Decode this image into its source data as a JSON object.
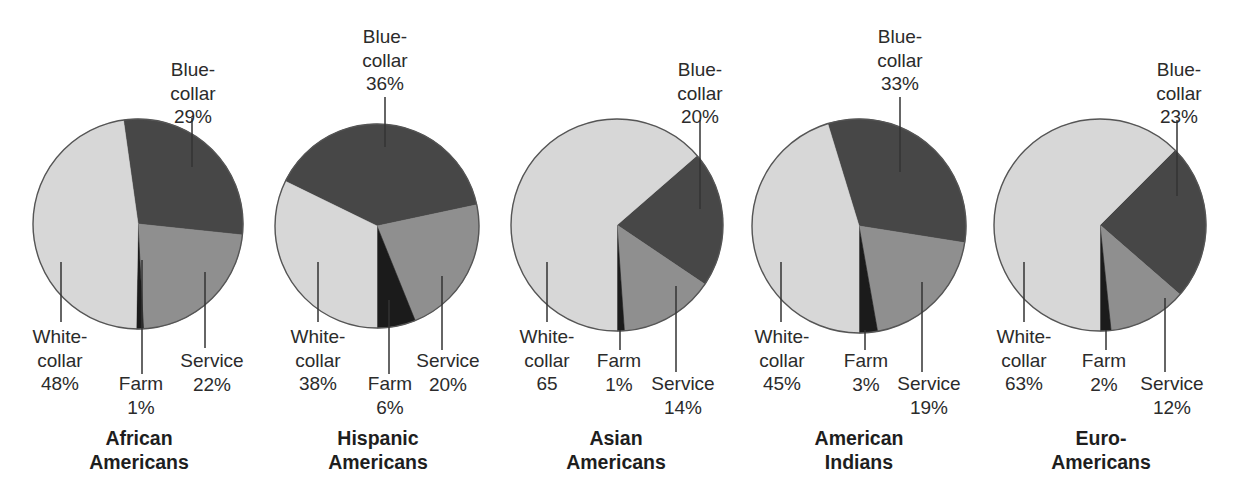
{
  "colors": {
    "white_collar": "#d7d7d7",
    "blue_collar": "#474747",
    "service": "#8f8f8f",
    "farm": "#1b1b1b",
    "outline": "#555555",
    "leader": "#333333"
  },
  "chart_data": {
    "type": "pie",
    "title": "",
    "categories": [
      "Blue-collar",
      "Service",
      "Farm",
      "White-collar"
    ],
    "charts": [
      {
        "title": "African Americans",
        "title_lines": [
          "African",
          "Americans"
        ],
        "center": [
          138,
          224
        ],
        "r": 105,
        "slices": [
          {
            "name": "Blue-collar",
            "value": 29,
            "label_lines": [
              "Blue-",
              "collar",
              "29%"
            ],
            "start": -8,
            "end": 96,
            "color": "blue_collar",
            "label": {
              "x": 193,
              "y": 58
            },
            "leader": [
              [
                192,
                118
              ],
              [
                192,
                167
              ]
            ]
          },
          {
            "name": "Service",
            "value": 22,
            "label_lines": [
              "Service",
              "22%"
            ],
            "start": 96,
            "end": 177,
            "color": "service",
            "label": {
              "x": 212,
              "y": 349
            },
            "leader": [
              [
                205,
                272
              ],
              [
                205,
                348
              ]
            ]
          },
          {
            "name": "Farm",
            "value": 1,
            "label_lines": [
              "Farm",
              "1%"
            ],
            "start": 177,
            "end": 181,
            "color": "farm",
            "label": {
              "x": 141,
              "y": 372
            },
            "leader": [
              [
                142,
                260
              ],
              [
                142,
                374
              ]
            ]
          },
          {
            "name": "White-collar",
            "value": 48,
            "label_lines": [
              "White-",
              "collar",
              "48%"
            ],
            "start": 181,
            "end": 352,
            "color": "white_collar",
            "label": {
              "x": 60,
              "y": 325
            },
            "leader": [
              [
                61,
                262
              ],
              [
                61,
                322
              ]
            ]
          }
        ]
      },
      {
        "title": "Hispanic Americans",
        "title_lines": [
          "Hispanic",
          "Americans"
        ],
        "center": [
          377,
          226
        ],
        "r": 102,
        "slices": [
          {
            "name": "Blue-collar",
            "value": 36,
            "label_lines": [
              "Blue-",
              "collar",
              "36%"
            ],
            "start": -64,
            "end": 78,
            "color": "blue_collar",
            "label": {
              "x": 385,
              "y": 25
            },
            "leader": [
              [
                385,
                97
              ],
              [
                385,
                147
              ]
            ]
          },
          {
            "name": "Service",
            "value": 20,
            "label_lines": [
              "Service",
              "20%"
            ],
            "start": 78,
            "end": 158,
            "color": "service",
            "label": {
              "x": 448,
              "y": 349
            },
            "leader": [
              [
                442,
                276
              ],
              [
                442,
                350
              ]
            ]
          },
          {
            "name": "Farm",
            "value": 6,
            "label_lines": [
              "Farm",
              "6%"
            ],
            "start": 158,
            "end": 180,
            "color": "farm",
            "label": {
              "x": 390,
              "y": 372
            },
            "leader": [
              [
                389,
                300
              ],
              [
                389,
                374
              ]
            ]
          },
          {
            "name": "White-collar",
            "value": 38,
            "label_lines": [
              "White-",
              "collar",
              "38%"
            ],
            "start": 180,
            "end": 296,
            "color": "white_collar",
            "label": {
              "x": 318,
              "y": 325
            },
            "leader": [
              [
                318,
                262
              ],
              [
                318,
                322
              ]
            ]
          }
        ]
      },
      {
        "title": "Asian Americans",
        "title_lines": [
          "Asian",
          "Americans"
        ],
        "center": [
          617,
          225
        ],
        "r": 106,
        "slices": [
          {
            "name": "Blue-collar",
            "value": 20,
            "label_lines": [
              "Blue-",
              "collar",
              "20%"
            ],
            "start": 49,
            "end": 124,
            "color": "blue_collar",
            "label": {
              "x": 700,
              "y": 58
            },
            "leader": [
              [
                700,
                120
              ],
              [
                700,
                209
              ]
            ]
          },
          {
            "name": "Service",
            "value": 14,
            "label_lines": [
              "Service",
              "14%"
            ],
            "start": 124,
            "end": 176,
            "color": "service",
            "label": {
              "x": 683,
              "y": 372
            },
            "leader": [
              [
                676,
                286
              ],
              [
                676,
                372
              ]
            ]
          },
          {
            "name": "Farm",
            "value": 1,
            "label_lines": [
              "Farm",
              "1%"
            ],
            "start": 176,
            "end": 180,
            "color": "farm",
            "label": {
              "x": 619,
              "y": 349
            },
            "leader": [
              [
                620,
                330
              ],
              [
                620,
                350
              ]
            ]
          },
          {
            "name": "White-collar",
            "value": 65,
            "label_lines": [
              "White-",
              "collar",
              "65"
            ],
            "start": 180,
            "end": 409,
            "color": "white_collar",
            "label": {
              "x": 547,
              "y": 325
            },
            "leader": [
              [
                547,
                262
              ],
              [
                547,
                322
              ]
            ]
          }
        ]
      },
      {
        "title": "American Indians",
        "title_lines": [
          "American",
          "Indians"
        ],
        "center": [
          859,
          226
        ],
        "r": 107,
        "slices": [
          {
            "name": "Blue-collar",
            "value": 33,
            "label_lines": [
              "Blue-",
              "collar",
              "33%"
            ],
            "start": -17,
            "end": 99,
            "color": "blue_collar",
            "label": {
              "x": 900,
              "y": 25
            },
            "leader": [
              [
                900,
                97
              ],
              [
                900,
                172
              ]
            ]
          },
          {
            "name": "Service",
            "value": 19,
            "label_lines": [
              "Service",
              "19%"
            ],
            "start": 99,
            "end": 170,
            "color": "service",
            "label": {
              "x": 929,
              "y": 372
            },
            "leader": [
              [
                922,
                282
              ],
              [
                922,
                372
              ]
            ]
          },
          {
            "name": "Farm",
            "value": 3,
            "label_lines": [
              "Farm",
              "3%"
            ],
            "start": 170,
            "end": 180,
            "color": "farm",
            "label": {
              "x": 866,
              "y": 349
            },
            "leader": [
              [
                865,
                330
              ],
              [
                865,
                350
              ]
            ]
          },
          {
            "name": "White-collar",
            "value": 45,
            "label_lines": [
              "White-",
              "collar",
              "45%"
            ],
            "start": 180,
            "end": 343,
            "color": "white_collar",
            "label": {
              "x": 782,
              "y": 325
            },
            "leader": [
              [
                781,
                262
              ],
              [
                781,
                322
              ]
            ]
          }
        ]
      },
      {
        "title": "Euro-Americans",
        "title_lines": [
          "Euro-",
          "Americans"
        ],
        "center": [
          1100,
          225
        ],
        "r": 106,
        "slices": [
          {
            "name": "Blue-collar",
            "value": 23,
            "label_lines": [
              "Blue-",
              "collar",
              "23%"
            ],
            "start": 45,
            "end": 131,
            "color": "blue_collar",
            "label": {
              "x": 1179,
              "y": 58
            },
            "leader": [
              [
                1177,
                120
              ],
              [
                1177,
                196
              ]
            ]
          },
          {
            "name": "Service",
            "value": 12,
            "label_lines": [
              "Service",
              "12%"
            ],
            "start": 131,
            "end": 174,
            "color": "service",
            "label": {
              "x": 1172,
              "y": 372
            },
            "leader": [
              [
                1165,
                298
              ],
              [
                1165,
                372
              ]
            ]
          },
          {
            "name": "Farm",
            "value": 2,
            "label_lines": [
              "Farm",
              "2%"
            ],
            "start": 174,
            "end": 180,
            "color": "farm",
            "label": {
              "x": 1104,
              "y": 349
            },
            "leader": [
              [
                1106,
                330
              ],
              [
                1106,
                350
              ]
            ]
          },
          {
            "name": "White-collar",
            "value": 63,
            "label_lines": [
              "White-",
              "collar",
              "63%"
            ],
            "start": 180,
            "end": 405,
            "color": "white_collar",
            "label": {
              "x": 1024,
              "y": 325
            },
            "leader": [
              [
                1024,
                262
              ],
              [
                1024,
                322
              ]
            ]
          }
        ]
      }
    ]
  },
  "title_positions": [
    {
      "x": 139,
      "y": 426
    },
    {
      "x": 378,
      "y": 426
    },
    {
      "x": 616,
      "y": 426
    },
    {
      "x": 859,
      "y": 426
    },
    {
      "x": 1101,
      "y": 426
    }
  ]
}
